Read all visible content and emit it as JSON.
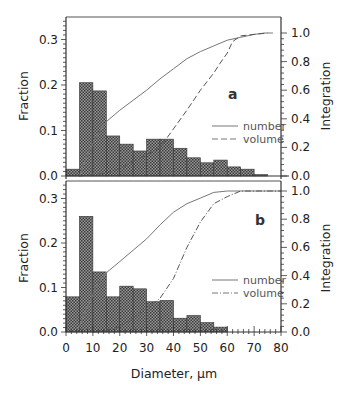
{
  "chart_data": [
    {
      "type": "bar",
      "panel": "a",
      "panel_label": "a",
      "xlabel": "Diameter, µm",
      "ylabel": "Fraction",
      "y2label": "Integration",
      "xlim": [
        0,
        80
      ],
      "ylim": [
        0,
        0.35
      ],
      "y2lim": [
        0,
        1.0
      ],
      "x_ticks": [
        "0",
        "10",
        "20",
        "30",
        "40",
        "50",
        "60",
        "70",
        "80"
      ],
      "y_ticks": [
        "0.0",
        "0.1",
        "0.2",
        "0.3"
      ],
      "y2_ticks": [
        "0.0",
        "0.2",
        "0.4",
        "0.6",
        "0.8",
        "1.0"
      ],
      "bin_width": 5,
      "bin_starts": [
        0,
        5,
        10,
        15,
        20,
        25,
        30,
        35,
        40,
        45,
        50,
        55,
        60,
        65,
        70
      ],
      "values": [
        0.015,
        0.205,
        0.187,
        0.088,
        0.07,
        0.055,
        0.081,
        0.081,
        0.061,
        0.04,
        0.029,
        0.035,
        0.02,
        0.015,
        0.003
      ],
      "series": [
        {
          "name": "number",
          "style": "solid",
          "x": [
            5,
            8,
            12,
            15,
            20,
            25,
            30,
            35,
            40,
            45,
            50,
            55,
            60,
            65,
            70,
            74,
            77
          ],
          "y": [
            0.0,
            0.15,
            0.3,
            0.38,
            0.46,
            0.53,
            0.6,
            0.68,
            0.75,
            0.82,
            0.87,
            0.91,
            0.95,
            0.97,
            0.99,
            1.0,
            1.0
          ]
        },
        {
          "name": "volume",
          "style": "dashed",
          "x": [
            5,
            10,
            15,
            20,
            25,
            30,
            35,
            40,
            45,
            50,
            55,
            57,
            60,
            62,
            65,
            70,
            75
          ],
          "y": [
            0.0,
            0.01,
            0.02,
            0.05,
            0.1,
            0.15,
            0.2,
            0.33,
            0.46,
            0.6,
            0.72,
            0.78,
            0.86,
            0.94,
            0.98,
            0.99,
            1.0
          ]
        }
      ],
      "legend": [
        "number",
        "volume"
      ],
      "legend_position": "right-middle"
    },
    {
      "type": "bar",
      "panel": "b",
      "panel_label": "b",
      "xlabel": "Diameter, µm",
      "ylabel": "Fraction",
      "y2label": "Integration",
      "xlim": [
        0,
        80
      ],
      "ylim": [
        0,
        0.34
      ],
      "y2lim": [
        0,
        1.0
      ],
      "x_ticks": [
        "0",
        "10",
        "20",
        "30",
        "40",
        "50",
        "60",
        "70",
        "80"
      ],
      "y_ticks": [
        "0.0",
        "0.1",
        "0.2",
        "0.3"
      ],
      "y2_ticks": [
        "0.0",
        "0.2",
        "0.4",
        "0.6",
        "0.8",
        "1.0"
      ],
      "bin_width": 5,
      "bin_starts": [
        0,
        5,
        10,
        15,
        20,
        25,
        30,
        35,
        40,
        45,
        50,
        55
      ],
      "values": [
        0.079,
        0.26,
        0.135,
        0.079,
        0.103,
        0.097,
        0.068,
        0.071,
        0.031,
        0.037,
        0.021,
        0.011
      ],
      "series": [
        {
          "name": "number",
          "style": "solid",
          "x": [
            4,
            8,
            12,
            15,
            20,
            25,
            30,
            35,
            40,
            45,
            50,
            55,
            60,
            80
          ],
          "y": [
            0.0,
            0.18,
            0.35,
            0.42,
            0.5,
            0.58,
            0.66,
            0.76,
            0.85,
            0.91,
            0.95,
            0.99,
            1.0,
            1.0
          ]
        },
        {
          "name": "volume",
          "style": "dash-dot",
          "x": [
            10,
            15,
            20,
            25,
            30,
            33,
            35,
            40,
            45,
            50,
            55,
            60,
            65,
            80
          ],
          "y": [
            0.0,
            0.01,
            0.04,
            0.1,
            0.17,
            0.21,
            0.24,
            0.38,
            0.6,
            0.78,
            0.91,
            0.96,
            1.0,
            1.0
          ]
        }
      ],
      "legend": [
        "number",
        "volume"
      ],
      "legend_position": "right-middle"
    }
  ],
  "labels": {
    "panel_a": "a",
    "panel_b": "b",
    "ylabel_left": "Fraction",
    "ylabel_right": "Integration",
    "xlabel": "Diameter, µm",
    "legend_number": "number",
    "legend_volume": "volume"
  }
}
